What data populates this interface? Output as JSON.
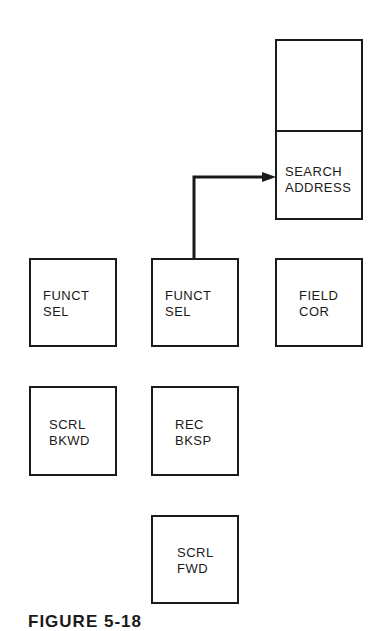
{
  "figure": {
    "caption": "FIGURE 5-18",
    "keys": [
      {
        "id": "blank",
        "label": ""
      },
      {
        "id": "search-address",
        "label": "SEARCH\nADDRESS"
      },
      {
        "id": "funct-sel-1",
        "label": "FUNCT\nSEL"
      },
      {
        "id": "funct-sel-2",
        "label": "FUNCT\nSEL"
      },
      {
        "id": "field-cor",
        "label": "FIELD\nCOR"
      },
      {
        "id": "scrl-bkwd",
        "label": "SCRL\nBKWD"
      },
      {
        "id": "rec-bksp",
        "label": "REC\nBKSP"
      },
      {
        "id": "scrl-fwd",
        "label": "SCRL\nFWD"
      }
    ],
    "connections": [
      {
        "from": "funct-sel-2",
        "to": "search-address",
        "type": "arrow"
      }
    ]
  }
}
